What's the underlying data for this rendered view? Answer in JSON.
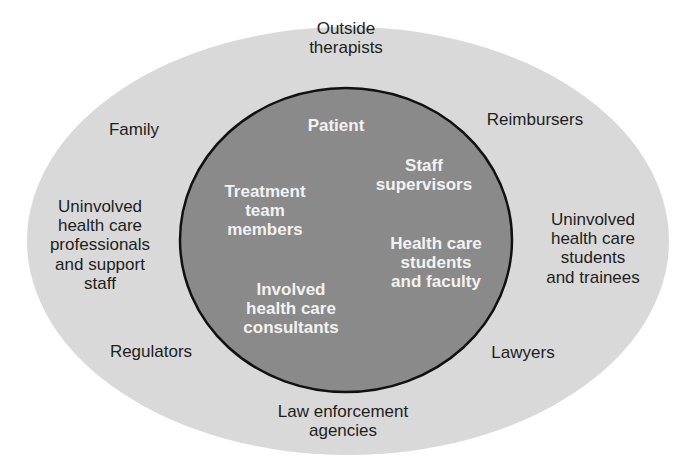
{
  "colors": {
    "outer_fill": "#d9d9d9",
    "inner_fill": "#8a8a8a",
    "inner_stroke": "#111111",
    "outer_text": "#1e1e1e",
    "inner_text": "#f2f2f2"
  },
  "outer_ring": {
    "labels": [
      {
        "id": "outside-therapists",
        "lines": [
          "Outside",
          "therapists"
        ]
      },
      {
        "id": "family",
        "lines": [
          "Family"
        ]
      },
      {
        "id": "reimbursers",
        "lines": [
          "Reimbursers"
        ]
      },
      {
        "id": "uninvolved-professionals",
        "lines": [
          "Uninvolved",
          "health care",
          "professionals",
          "and support",
          "staff"
        ]
      },
      {
        "id": "uninvolved-students",
        "lines": [
          "Uninvolved",
          "health care",
          "students",
          "and trainees"
        ]
      },
      {
        "id": "regulators",
        "lines": [
          "Regulators"
        ]
      },
      {
        "id": "lawyers",
        "lines": [
          "Lawyers"
        ]
      },
      {
        "id": "law-enforcement",
        "lines": [
          "Law enforcement",
          "agencies"
        ]
      }
    ]
  },
  "inner_circle": {
    "labels": [
      {
        "id": "patient",
        "lines": [
          "Patient"
        ]
      },
      {
        "id": "staff-supervisors",
        "lines": [
          "Staff",
          "supervisors"
        ]
      },
      {
        "id": "treatment-team",
        "lines": [
          "Treatment",
          "team",
          "members"
        ]
      },
      {
        "id": "health-care-students-faculty",
        "lines": [
          "Health care",
          "students",
          "and faculty"
        ]
      },
      {
        "id": "involved-consultants",
        "lines": [
          "Involved",
          "health care",
          "consultants"
        ]
      }
    ]
  }
}
